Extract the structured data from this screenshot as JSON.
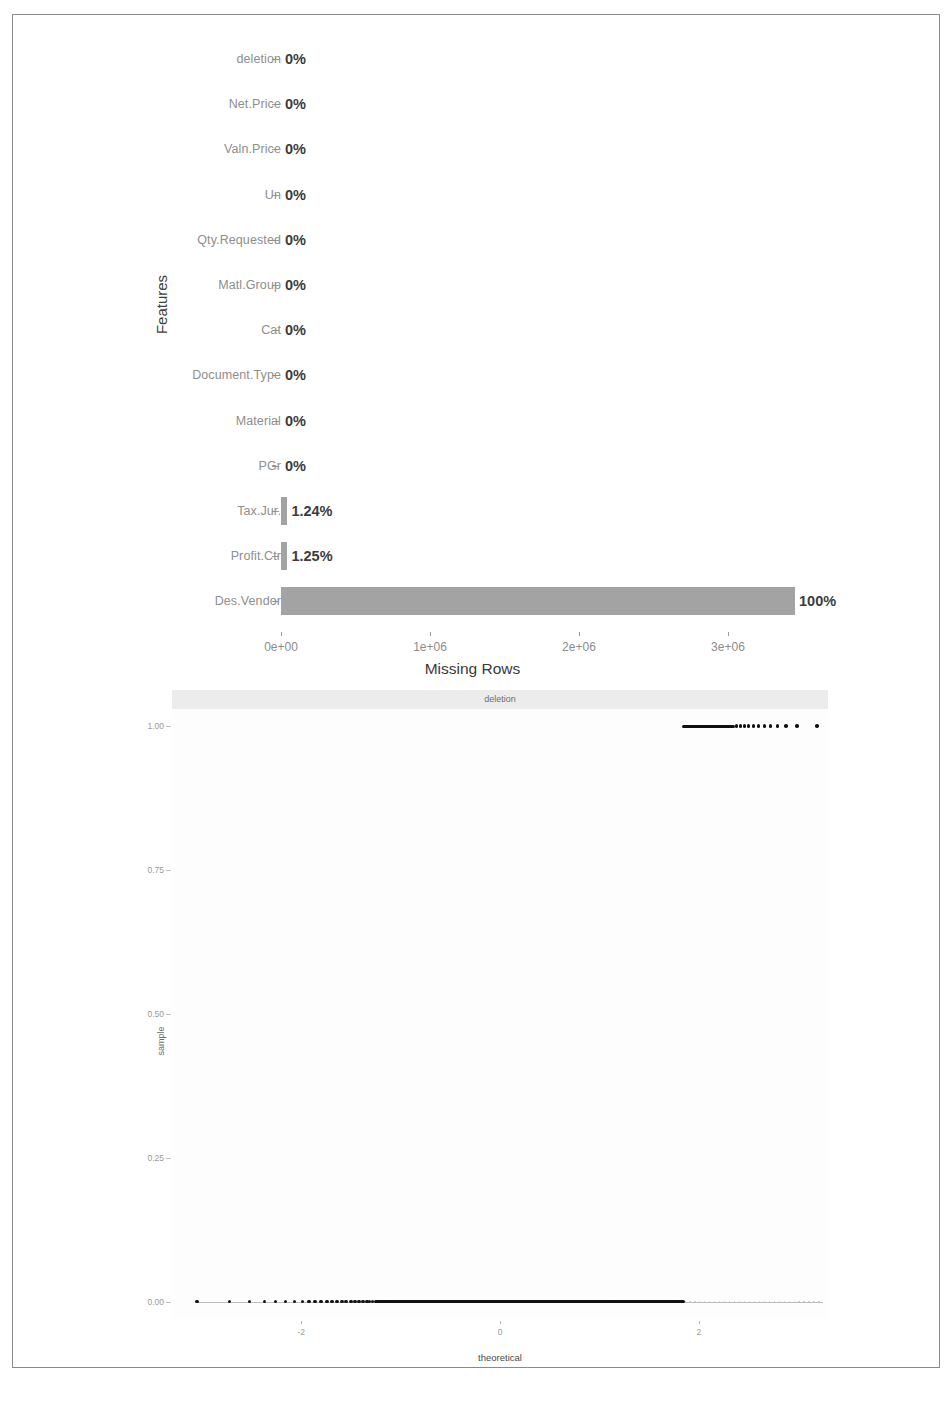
{
  "chart_data": [
    {
      "type": "bar",
      "title": "",
      "xlabel": "Missing Rows",
      "ylabel": "Features",
      "orientation": "horizontal",
      "xlim": [
        0,
        3450000
      ],
      "xticks": [
        0,
        1000000,
        2000000,
        3000000
      ],
      "xtick_labels": [
        "0e+00",
        "1e+06",
        "2e+06",
        "3e+06"
      ],
      "grid": false,
      "bar_color": "#a3a3a3",
      "categories": [
        "deletion",
        "Net.Price",
        "Valn.Price",
        "Un",
        "Qty.Requested",
        "Matl.Group",
        "Cat",
        "Document.Type",
        "Material",
        "PGr",
        "Tax.Jur.",
        "Profit.Ctr",
        "Des.Vendor"
      ],
      "values": [
        0,
        0,
        0,
        0,
        0,
        0,
        0,
        0,
        0,
        0,
        42800,
        43100,
        3450000
      ],
      "data_labels": [
        "0%",
        "0%",
        "0%",
        "0%",
        "0%",
        "0%",
        "0%",
        "0%",
        "0%",
        "0%",
        "1.24%",
        "1.25%",
        "100%"
      ]
    },
    {
      "type": "scatter",
      "subtype": "qq-plot",
      "facet_label": "deletion",
      "xlabel": "theoretical",
      "ylabel": "sample",
      "xticks": [
        -2,
        0,
        2
      ],
      "xtick_labels": [
        "-2",
        "0",
        "2"
      ],
      "yticks": [
        0.0,
        0.25,
        0.5,
        0.75,
        1.0
      ],
      "ytick_labels": [
        "0.00",
        "0.25",
        "0.50",
        "0.75",
        "1.00"
      ],
      "xlim": [
        -3.3,
        3.3
      ],
      "ylim": [
        -0.03,
        1.03
      ],
      "grid": false,
      "point_color": "#111111",
      "description": "Binary variable QQ plot: dense mass of points at sample=0.00 across theoretical -3.0 to 1.85, and a second band of points at sample=1.00 from theoretical 1.85 to 3.2",
      "series": [
        {
          "name": "sample=0.00",
          "y": 0.0,
          "x_theoretical_range": [
            -3.05,
            1.85
          ],
          "dense_x_range": [
            -1.25,
            1.85
          ]
        },
        {
          "name": "sample=1.00",
          "y": 1.0,
          "x_theoretical_range": [
            1.85,
            3.2
          ],
          "dense_x_range": [
            1.85,
            2.35
          ]
        }
      ]
    }
  ],
  "missing_chart": {
    "y_axis_title": "Features",
    "x_axis_title": "Missing Rows",
    "x_tick_labels": [
      "0e+00",
      "1e+06",
      "2e+06",
      "3e+06"
    ],
    "rows": [
      {
        "label": "deletion",
        "value_label": "0%"
      },
      {
        "label": "Net.Price",
        "value_label": "0%"
      },
      {
        "label": "Valn.Price",
        "value_label": "0%"
      },
      {
        "label": "Un",
        "value_label": "0%"
      },
      {
        "label": "Qty.Requested",
        "value_label": "0%"
      },
      {
        "label": "Matl.Group",
        "value_label": "0%"
      },
      {
        "label": "Cat",
        "value_label": "0%"
      },
      {
        "label": "Document.Type",
        "value_label": "0%"
      },
      {
        "label": "Material",
        "value_label": "0%"
      },
      {
        "label": "PGr",
        "value_label": "0%"
      },
      {
        "label": "Tax.Jur.",
        "value_label": "1.24%"
      },
      {
        "label": "Profit.Ctr",
        "value_label": "1.25%"
      },
      {
        "label": "Des.Vendor",
        "value_label": "100%"
      }
    ],
    "tick_dash": "–"
  },
  "qq_chart": {
    "strip_label": "deletion",
    "y_axis_title": "sample",
    "x_axis_title": "theoretical",
    "y_tick_labels": [
      "1.00",
      "0.75",
      "0.50",
      "0.25",
      "0.00"
    ],
    "x_tick_labels": [
      "-2",
      "0",
      "2"
    ],
    "tick_dash": "–"
  }
}
